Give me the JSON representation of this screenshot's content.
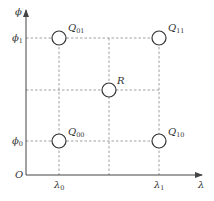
{
  "diagram": {
    "type": "bilinear-interpolation-grid",
    "axes": {
      "y_label": "ϕ",
      "x_label": "λ",
      "origin_label": "O"
    },
    "y_ticks": [
      {
        "base": "ϕ",
        "sub": "1"
      },
      {
        "base": "ϕ",
        "sub": "0"
      }
    ],
    "x_ticks": [
      {
        "base": "λ",
        "sub": "0"
      },
      {
        "base": "λ",
        "sub": "1"
      }
    ],
    "points": [
      {
        "base": "Q",
        "sub": "01",
        "position": "top-left"
      },
      {
        "base": "Q",
        "sub": "11",
        "position": "top-right"
      },
      {
        "base": "R",
        "sub": "",
        "position": "center"
      },
      {
        "base": "Q",
        "sub": "00",
        "position": "bottom-left"
      },
      {
        "base": "Q",
        "sub": "10",
        "position": "bottom-right"
      }
    ],
    "colors": {
      "axis": "#444444",
      "grid": "#777777",
      "circle": "#333333",
      "text": "#333333"
    }
  }
}
